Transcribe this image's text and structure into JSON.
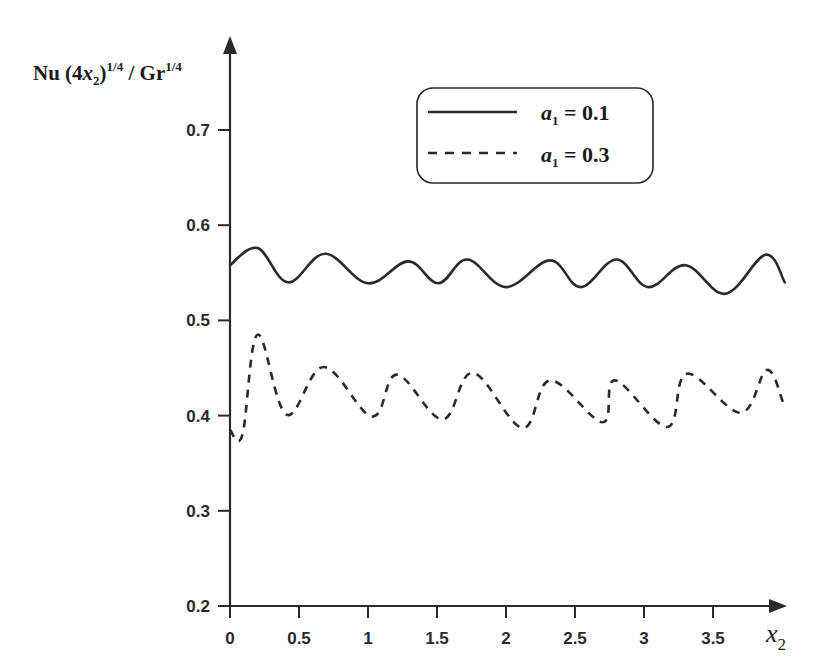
{
  "chart_data": {
    "type": "line",
    "title": "",
    "ylabel": {
      "text": "Nu (4x2)^1/4 / Gr^1/4",
      "parts": {
        "a": "Nu (4",
        "b": "x",
        "c": "2",
        "d": ")",
        "e": "1/4",
        "f": " / Gr",
        "g": "1/4"
      }
    },
    "xlabel": {
      "text": "x2",
      "main": "x",
      "sub": "2"
    },
    "xlim": [
      0,
      4.0
    ],
    "ylim": [
      0.2,
      0.75
    ],
    "xticks": [
      0,
      0.5,
      1,
      1.5,
      2,
      2.5,
      3,
      3.5
    ],
    "xtick_labels": [
      "0",
      "0.5",
      "1",
      "1.5",
      "2",
      "2.5",
      "3",
      "3.5"
    ],
    "yticks": [
      0.2,
      0.3,
      0.4,
      0.5,
      0.6,
      0.7
    ],
    "ytick_labels": [
      "0.2",
      "0.3",
      "0.4",
      "0.5",
      "0.6",
      "0.7"
    ],
    "grid": false,
    "legend_position": "upper-right, rounded box",
    "series": [
      {
        "name": "a1 = 0.1",
        "label_main": "a",
        "label_sub": "1",
        "label_value": " = 0.1",
        "style": "solid",
        "color": "#2a2a2a",
        "x": [
          0,
          0.2,
          0.42,
          0.69,
          1.0,
          1.29,
          1.51,
          1.72,
          2.0,
          2.32,
          2.54,
          2.8,
          3.03,
          3.3,
          3.59,
          3.88,
          4.02
        ],
        "y": [
          0.558,
          0.576,
          0.54,
          0.57,
          0.539,
          0.562,
          0.539,
          0.564,
          0.535,
          0.563,
          0.535,
          0.564,
          0.535,
          0.558,
          0.528,
          0.569,
          0.54
        ]
      },
      {
        "name": "a1 = 0.3",
        "label_main": "a",
        "label_sub": "1",
        "label_value": " = 0.3",
        "style": "dashed",
        "color": "#2a2a2a",
        "x": [
          0,
          0.09,
          0.2,
          0.41,
          0.68,
          1.03,
          1.21,
          1.54,
          1.76,
          2.12,
          2.32,
          2.7,
          2.79,
          3.17,
          3.31,
          3.7,
          3.89,
          4.01
        ],
        "y": [
          0.385,
          0.38,
          0.485,
          0.401,
          0.451,
          0.399,
          0.443,
          0.396,
          0.445,
          0.387,
          0.437,
          0.393,
          0.437,
          0.388,
          0.444,
          0.403,
          0.448,
          0.413
        ]
      }
    ]
  }
}
